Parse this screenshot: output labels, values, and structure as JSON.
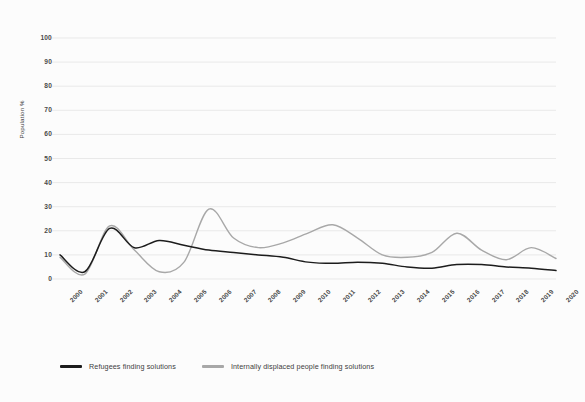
{
  "chart_data": {
    "type": "line",
    "title": "",
    "subtitle": "",
    "xlabel": "",
    "ylabel": "Population %",
    "ylim": [
      0,
      100
    ],
    "yticks": [
      0,
      10,
      20,
      30,
      40,
      50,
      60,
      70,
      80,
      90,
      100
    ],
    "grid": true,
    "legend_position": "bottom-left",
    "categories": [
      "2000",
      "2001",
      "2002",
      "2003",
      "2004",
      "2005",
      "2006",
      "2007",
      "2008",
      "2009",
      "2010",
      "2011",
      "2012",
      "2013",
      "2014",
      "2015",
      "2016",
      "2017",
      "2018",
      "2019",
      "2020"
    ],
    "series": [
      {
        "name": "Refugees finding solutions",
        "color": "#1c1c1c",
        "values": [
          10,
          3,
          21,
          13,
          16,
          14,
          12,
          11,
          10,
          9,
          7,
          6.5,
          7,
          6.5,
          5,
          4.5,
          6,
          6,
          5,
          4.5,
          3.5
        ]
      },
      {
        "name": "Internally displaced people finding solutions",
        "color": "#a8a8a8",
        "values": [
          9,
          2,
          22,
          12,
          3,
          7,
          29,
          17,
          13,
          15,
          19,
          22.5,
          17,
          10,
          9,
          11,
          19,
          12,
          8,
          13,
          8.5
        ]
      }
    ]
  },
  "legend": {
    "items": [
      {
        "label": "Refugees finding solutions",
        "color": "#1c1c1c"
      },
      {
        "label": "Internally displaced people finding solutions",
        "color": "#a8a8a8"
      }
    ]
  },
  "axes": {
    "y_title": "Population %",
    "y_tick_labels": [
      "100",
      "90",
      "80",
      "70",
      "60",
      "50",
      "40",
      "30",
      "20",
      "10",
      "0"
    ],
    "x_tick_labels": [
      "2000",
      "2001",
      "2002",
      "2003",
      "2004",
      "2005",
      "2006",
      "2007",
      "2008",
      "2009",
      "2010",
      "2011",
      "2012",
      "2013",
      "2014",
      "2015",
      "2016",
      "2017",
      "2018",
      "2019",
      "2020"
    ]
  },
  "colors": {
    "background": "#fcfcfc",
    "grid": "#e9e9e9",
    "text": "#4a4a4a",
    "series_refugees": "#1c1c1c",
    "series_idp": "#a8a8a8"
  }
}
